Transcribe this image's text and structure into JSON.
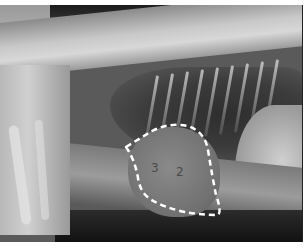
{
  "image": {
    "type": "lateral thoracic radiograph",
    "description": "Lateral chest X-ray with the cardiac silhouette outlined by a white dashed line",
    "outline_color": "#ffffff",
    "labels": [
      {
        "text": "3",
        "x": 155,
        "y": 172
      },
      {
        "text": "2",
        "x": 180,
        "y": 176
      }
    ]
  }
}
